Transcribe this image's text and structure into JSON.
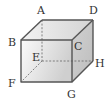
{
  "figure": {
    "type": "cube",
    "vertices": {
      "A": {
        "label": "A",
        "x": 42,
        "y": 20
      },
      "D": {
        "label": "D",
        "x": 93,
        "y": 20
      },
      "B": {
        "label": "B",
        "x": 21,
        "y": 40
      },
      "C": {
        "label": "C",
        "x": 72,
        "y": 40
      },
      "E": {
        "label": "E",
        "x": 42,
        "y": 61
      },
      "H": {
        "label": "H",
        "x": 93,
        "y": 61
      },
      "F": {
        "label": "F",
        "x": 21,
        "y": 82
      },
      "G": {
        "label": "G",
        "x": 72,
        "y": 82
      }
    },
    "hidden_edges": [
      "AE",
      "EF",
      "EH"
    ],
    "colors": {
      "edge": "#555555",
      "hidden_edge": "#666666",
      "front_face_light": "#fbfbfb",
      "front_face_dark": "#cfcfcf",
      "top_face_light": "#f4f4f4",
      "top_face_dark": "#d6d6d6",
      "right_face": "#c8c8c8"
    }
  }
}
